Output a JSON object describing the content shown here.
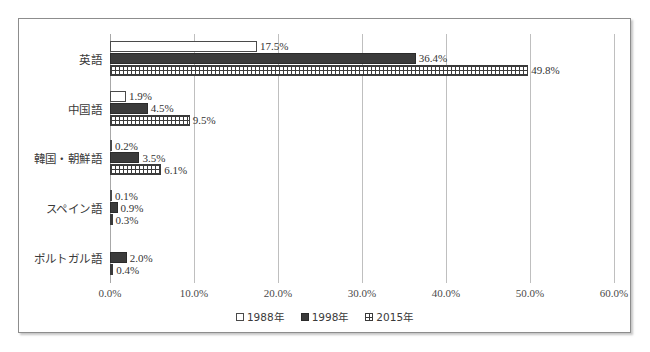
{
  "chart_data": {
    "type": "bar",
    "orientation": "horizontal",
    "title": "",
    "xlabel": "",
    "ylabel": "",
    "xlim": [
      0,
      60
    ],
    "grid": true,
    "legend_position": "bottom-center",
    "tick_labels": [
      "0.0%",
      "10.0%",
      "20.0%",
      "30.0%",
      "40.0%",
      "50.0%",
      "60.0%"
    ],
    "tick_values": [
      0,
      10,
      20,
      30,
      40,
      50,
      60
    ],
    "categories": [
      "英語",
      "中国語",
      "韓国・朝鮮語",
      "スペイン語",
      "ポルトガル語"
    ],
    "series": [
      {
        "name": "1988年",
        "swatch": "hollow",
        "values": [
          17.5,
          1.9,
          0.2,
          0.1,
          null
        ],
        "labels": [
          "17.5%",
          "1.9%",
          "0.2%",
          "0.1%",
          ""
        ]
      },
      {
        "name": "1998年",
        "swatch": "solid-dark",
        "values": [
          36.4,
          4.5,
          3.5,
          0.9,
          2.0
        ],
        "labels": [
          "36.4%",
          "4.5%",
          "3.5%",
          "0.9%",
          "2.0%"
        ]
      },
      {
        "name": "2015年",
        "swatch": "crosshatch",
        "values": [
          49.8,
          9.5,
          6.1,
          0.3,
          0.4
        ],
        "labels": [
          "49.8%",
          "9.5%",
          "6.1%",
          "0.3%",
          "0.4%"
        ]
      }
    ]
  },
  "colors": {
    "series_1988": "#ffffff",
    "series_1998": "#3b3b3b",
    "series_2015": "#3b3b3b",
    "gridline": "#bfbfbf",
    "frame_border": "#8d8d8d",
    "text": "#333333",
    "background": "#ffffff"
  }
}
